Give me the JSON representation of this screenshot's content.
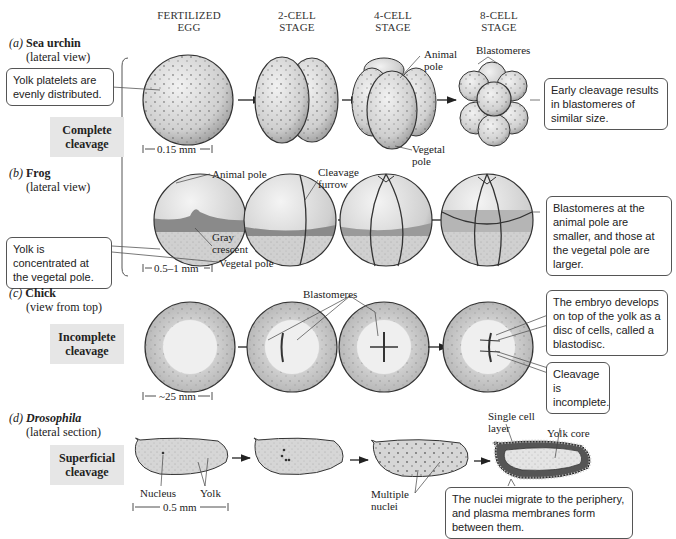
{
  "stage_headers": [
    {
      "line1": "FERTILIZED",
      "line2": "EGG"
    },
    {
      "line1": "2-CELL",
      "line2": "STAGE"
    },
    {
      "line1": "4-CELL",
      "line2": "STAGE"
    },
    {
      "line1": "8-CELL",
      "line2": "STAGE"
    }
  ],
  "sections": {
    "a": {
      "letter": "(a)",
      "organism": "Sea urchin",
      "view": "(lateral view)",
      "callout_left": "Yolk platelets are evenly distributed.",
      "callout_right": "Early cleavage results in blastomeres of similar size.",
      "labels": {
        "animal_pole": "Animal pole",
        "vegetal_pole": "Vegetal pole",
        "blastomeres": "Blastomeres"
      },
      "scale": "0.15 mm"
    },
    "b": {
      "letter": "(b)",
      "organism": "Frog",
      "view": "(lateral view)",
      "callout_left": "Yolk is concentrated at the vegetal pole.",
      "callout_right": "Blastomeres at the animal pole are smaller, and those at the vegetal pole are larger.",
      "labels": {
        "animal_pole": "Animal pole",
        "gray_crescent": "Gray crescent",
        "vegetal_pole": "Vegetal pole",
        "cleavage_furrow": "Cleavage furrow"
      },
      "scale": "0.5–1 mm"
    },
    "c": {
      "letter": "(c)",
      "organism": "Chick",
      "view": "(view from top)",
      "callout_blastodisc": "The embryo develops on top of the yolk as a disc of cells, called a blastodisc.",
      "callout_incomplete": "Cleavage is incomplete.",
      "labels": {
        "blastomeres": "Blastomeres"
      },
      "scale": "~25 mm"
    },
    "d": {
      "letter": "(d)",
      "organism": "Drosophila",
      "view": "(lateral section)",
      "callout": "The nuclei migrate to the periphery, and plasma membranes form between them.",
      "labels": {
        "nucleus": "Nucleus",
        "yolk": "Yolk",
        "multiple_nuclei": "Multiple nuclei",
        "single_cell_layer": "Single cell layer",
        "yolk_core": "Yolk core"
      },
      "scale": "0.5 mm"
    }
  },
  "categories": {
    "complete": "Complete cleavage",
    "incomplete": "Incomplete cleavage",
    "superficial": "Superficial cleavage"
  },
  "colors": {
    "egg_fill": "#d9d9d9",
    "yolk_fill": "#c8c8c8",
    "gray_crescent": "#8a8a8a",
    "category_box": "#e6e6e6",
    "outline": "#333333"
  }
}
